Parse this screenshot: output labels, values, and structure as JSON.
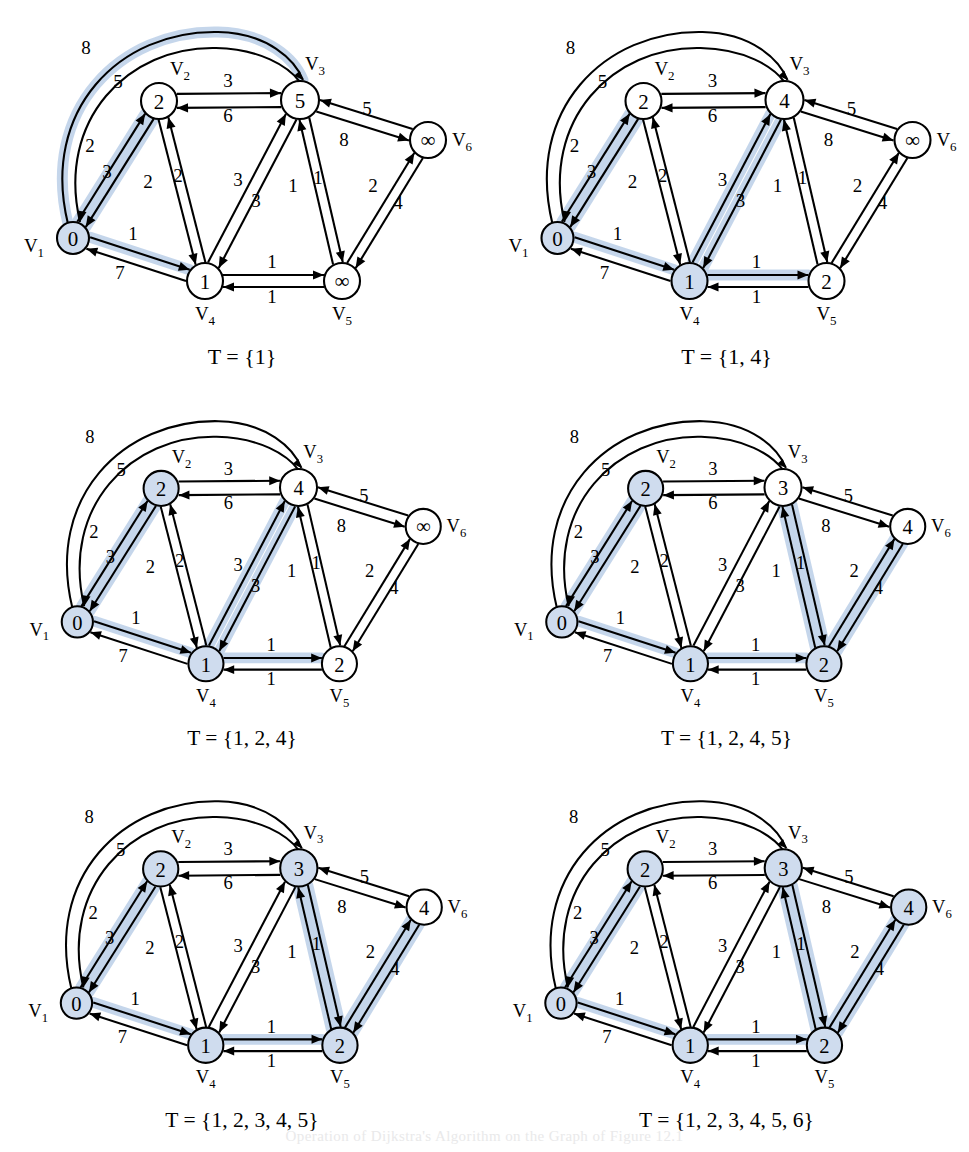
{
  "figure": {
    "bottom_caption": "Operation of Dijkstra's Algorithm on the Graph of Figure 12.1",
    "highlight_color": "#c2d4ea",
    "node_fill_active": "#cfdcee",
    "node_fill_inactive": "#ffffff",
    "stroke_color": "#000000"
  },
  "graph": {
    "vertex_labels": [
      {
        "id": "v1",
        "text": "V",
        "sub": "1"
      },
      {
        "id": "v2",
        "text": "V",
        "sub": "2"
      },
      {
        "id": "v3",
        "text": "V",
        "sub": "3"
      },
      {
        "id": "v4",
        "text": "V",
        "sub": "4"
      },
      {
        "id": "v5",
        "text": "V",
        "sub": "5"
      },
      {
        "id": "v6",
        "text": "V",
        "sub": "6"
      }
    ],
    "edge_weights": {
      "v1_v3_arc": "8",
      "v1_v2_out": "5",
      "v2_v1_in": "2",
      "v1_v2_low": "3",
      "v2_v4_a": "2",
      "v2_v4_b": "2",
      "v2_v3_top": "3",
      "v3_v2_bottom": "6",
      "v1_v4_top": "1",
      "v4_v1_bottom": "7",
      "v4_v3_a": "3",
      "v4_v3_b": "3",
      "v3_v5_a": "1",
      "v3_v5_b": "1",
      "v4_v5_top": "1",
      "v5_v4_bottom": "1",
      "v3_v6": "8",
      "v6_v3": "5",
      "v5_v6": "2",
      "v6_v5": "4"
    }
  },
  "panels": [
    {
      "id": "panel-1",
      "caption": "T = {1}",
      "node_values": {
        "v1": "0",
        "v2": "2",
        "v3": "5",
        "v4": "1",
        "v5": "∞",
        "v6": "∞"
      },
      "node_active": {
        "v1": true,
        "v2": false,
        "v3": false,
        "v4": false,
        "v5": false,
        "v6": false
      },
      "highlighted_edges": [
        "v1_v3_arc",
        "v1_v2",
        "v1_v4"
      ]
    },
    {
      "id": "panel-2",
      "caption": "T = {1, 4}",
      "node_values": {
        "v1": "0",
        "v2": "2",
        "v3": "4",
        "v4": "1",
        "v5": "2",
        "v6": "∞"
      },
      "node_active": {
        "v1": true,
        "v2": false,
        "v3": false,
        "v4": true,
        "v5": false,
        "v6": false
      },
      "highlighted_edges": [
        "v1_v2",
        "v1_v4",
        "v4_v3",
        "v4_v5"
      ]
    },
    {
      "id": "panel-3",
      "caption": "T = {1, 2, 4}",
      "node_values": {
        "v1": "0",
        "v2": "2",
        "v3": "4",
        "v4": "1",
        "v5": "2",
        "v6": "∞"
      },
      "node_active": {
        "v1": true,
        "v2": true,
        "v3": false,
        "v4": true,
        "v5": false,
        "v6": false
      },
      "highlighted_edges": [
        "v1_v2",
        "v1_v4",
        "v4_v3",
        "v4_v5"
      ]
    },
    {
      "id": "panel-4",
      "caption": "T = {1, 2, 4, 5}",
      "node_values": {
        "v1": "0",
        "v2": "2",
        "v3": "3",
        "v4": "1",
        "v5": "2",
        "v6": "4"
      },
      "node_active": {
        "v1": true,
        "v2": true,
        "v3": false,
        "v4": true,
        "v5": true,
        "v6": false
      },
      "highlighted_edges": [
        "v1_v2",
        "v1_v4",
        "v4_v5",
        "v5_v3",
        "v5_v6"
      ]
    },
    {
      "id": "panel-5",
      "caption": "T = {1, 2, 3, 4, 5}",
      "node_values": {
        "v1": "0",
        "v2": "2",
        "v3": "3",
        "v4": "1",
        "v5": "2",
        "v6": "4"
      },
      "node_active": {
        "v1": true,
        "v2": true,
        "v3": true,
        "v4": true,
        "v5": true,
        "v6": false
      },
      "highlighted_edges": [
        "v1_v2",
        "v1_v4",
        "v4_v5",
        "v5_v3",
        "v5_v6"
      ]
    },
    {
      "id": "panel-6",
      "caption": "T = {1, 2, 3, 4, 5, 6}",
      "node_values": {
        "v1": "0",
        "v2": "2",
        "v3": "3",
        "v4": "1",
        "v5": "2",
        "v6": "4"
      },
      "node_active": {
        "v1": true,
        "v2": true,
        "v3": true,
        "v4": true,
        "v5": true,
        "v6": true
      },
      "highlighted_edges": [
        "v1_v2",
        "v1_v4",
        "v4_v5",
        "v5_v3",
        "v5_v6"
      ]
    }
  ]
}
